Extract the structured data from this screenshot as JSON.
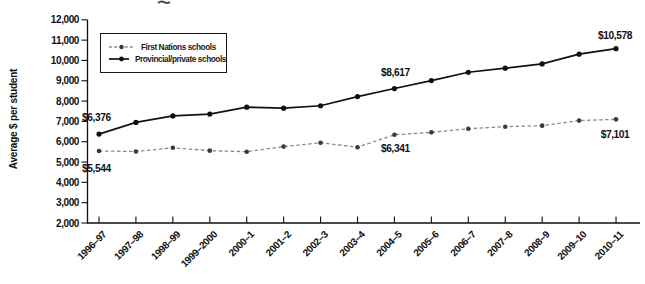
{
  "figure": {
    "cropped_title_fragment": true
  },
  "chart_data": {
    "type": "line",
    "title": "",
    "xlabel": "",
    "ylabel": "Average $ per student",
    "ylim": [
      2000,
      12000
    ],
    "grid": false,
    "legend_position": "top-left-inside",
    "ytick_values": [
      2000,
      3000,
      4000,
      5000,
      6000,
      7000,
      8000,
      9000,
      10000,
      11000,
      12000
    ],
    "ytick_labels": [
      "2,000",
      "3,000",
      "4,000",
      "5,000",
      "6,000",
      "7,000",
      "8,000",
      "9,000",
      "10,000",
      "11,000",
      "12,000"
    ],
    "categories": [
      "1996–97",
      "1997–98",
      "1998–99",
      "1999–2000",
      "2000–1",
      "2001–2",
      "2002–3",
      "2003–4",
      "2004–5",
      "2005–6",
      "2006–7",
      "2007–8",
      "2008–9",
      "2009–10",
      "2010–11"
    ],
    "series": [
      {
        "name": "First Nations schools",
        "style": "dashed",
        "line_color": "#8a8a8a",
        "marker_color": "#3a3a3a",
        "values": [
          5544,
          5520,
          5700,
          5560,
          5510,
          5760,
          5950,
          5730,
          6341,
          6460,
          6640,
          6740,
          6790,
          7040,
          7101
        ]
      },
      {
        "name": "Provincial/private schools",
        "style": "solid",
        "line_color": "#111111",
        "marker_color": "#111111",
        "values": [
          6376,
          6950,
          7270,
          7360,
          7700,
          7650,
          7770,
          8220,
          8617,
          9010,
          9420,
          9620,
          9830,
          10310,
          10578
        ]
      }
    ],
    "annotations": [
      {
        "text": "$6,376",
        "series": 1,
        "index": 0,
        "anchor": "start",
        "dx": -17,
        "dy": -13
      },
      {
        "text": "$5,544",
        "series": 0,
        "index": 0,
        "anchor": "start",
        "dx": -17,
        "dy": 21
      },
      {
        "text": "$8,617",
        "series": 1,
        "index": 8,
        "anchor": "middle",
        "dx": 1,
        "dy": -13
      },
      {
        "text": "$6,341",
        "series": 0,
        "index": 8,
        "anchor": "middle",
        "dx": 1,
        "dy": 17
      },
      {
        "text": "$10,578",
        "series": 1,
        "index": 14,
        "anchor": "middle",
        "dx": -1,
        "dy": -10
      },
      {
        "text": "$7,101",
        "series": 0,
        "index": 14,
        "anchor": "middle",
        "dx": -1,
        "dy": 19
      }
    ]
  }
}
